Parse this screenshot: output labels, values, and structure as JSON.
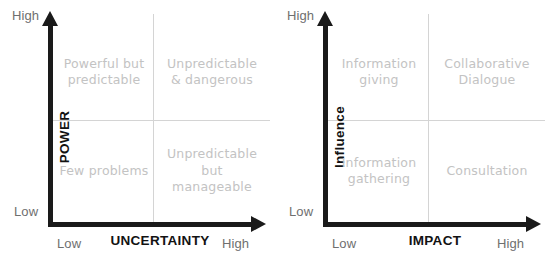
{
  "matrices": [
    {
      "id": "power-uncertainty-matrix",
      "y_axis": {
        "title": "POWER",
        "high_label": "High",
        "low_label": "Low"
      },
      "x_axis": {
        "title": "UNCERTAINTY",
        "high_label": "High",
        "low_label": "Low"
      },
      "quadrants": {
        "top_left": "Powerful but\npredictable",
        "top_right": "Unpredictable\n& dangerous",
        "bottom_left": "Few problems",
        "bottom_right": "Unpredictable\nbut\nmanageable"
      }
    },
    {
      "id": "influence-impact-matrix",
      "y_axis": {
        "title": "Influence",
        "high_label": "High",
        "low_label": "Low"
      },
      "x_axis": {
        "title": "IMPACT",
        "high_label": "High",
        "low_label": "Low"
      },
      "quadrants": {
        "top_left": "Information\ngiving",
        "top_right": "Collaborative\nDialogue",
        "bottom_left": "Information\ngathering",
        "bottom_right": "Consultation"
      }
    }
  ],
  "colors": {
    "axis": "#1a1a1a",
    "gridline": "#d4d4d4",
    "quadrant_text": "#c3c3c3",
    "tick_text": "#6f6f6f",
    "title_text": "#121212",
    "background": "#ffffff"
  }
}
